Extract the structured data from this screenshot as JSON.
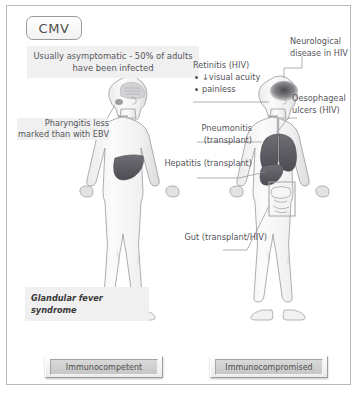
{
  "diagram": {
    "title": "CMV",
    "banner": "Usually asymptomatic - 50% of adults have been infected",
    "left_panel": {
      "label": "Immunocompetent",
      "findings": {
        "pharyngitis": "Pharyngitis less marked than with EBV",
        "glandular": "Glandular fever syndrome"
      }
    },
    "right_panel": {
      "label": "Immunocompromised",
      "findings": {
        "retinitis_title": "Retinitis (HIV)",
        "retinitis_b1": "↓visual acuity",
        "retinitis_b2": "painless",
        "neurological": "Neurological disease in HIV",
        "oesophageal": "Oesophageal ulcers (HIV)",
        "pneumonitis": "Pneumonitis (transplant)",
        "hepatitis": "Hepatitis (transplant)",
        "gut": "Gut (transplant/HIV)"
      }
    },
    "colors": {
      "border": "#b9b9b9",
      "text": "#55555a",
      "organ_dark": "#5e5e63",
      "body_fill": "#f4f4f4",
      "shade": "#f0f0f0"
    }
  }
}
